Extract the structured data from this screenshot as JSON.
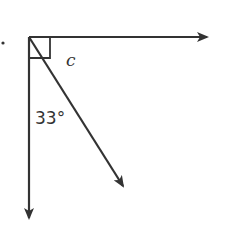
{
  "diagram": {
    "type": "angle-diagram",
    "labels": {
      "unknown_angle": "c",
      "given_angle": "33°"
    },
    "colors": {
      "stroke": "#333333",
      "background": "#ffffff"
    },
    "elements": {
      "vertex": "common-endpoint",
      "rays": [
        "horizontal-right",
        "vertical-down",
        "diagonal-down-right"
      ],
      "right_angle_marker": true,
      "bullet_marker": true
    }
  }
}
